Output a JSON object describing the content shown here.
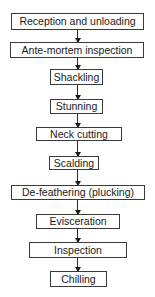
{
  "flowchart": {
    "steps": [
      {
        "label": "Reception and unloading"
      },
      {
        "label": "Ante-mortem inspection"
      },
      {
        "label": "Shackling"
      },
      {
        "label": "Stunning"
      },
      {
        "label": "Neck cutting"
      },
      {
        "label": "Scalding"
      },
      {
        "label": "De-feathering (plucking)"
      },
      {
        "label": "Evisceration"
      },
      {
        "label": "Inspection"
      },
      {
        "label": "Chilling"
      }
    ],
    "colors": {
      "box_border": "#3a3a3a",
      "text": "#1a1a1a",
      "arrow": "#2a2a2a",
      "background": "#ffffff"
    }
  }
}
